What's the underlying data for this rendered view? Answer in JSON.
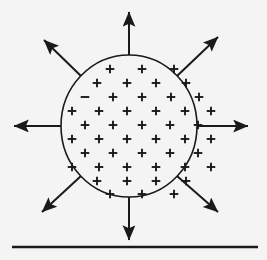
{
  "figure": {
    "background_color": "#f4f4f4",
    "ink_color": "#1a1a1a",
    "width": 267,
    "height": 260
  },
  "sphere": {
    "label": "charged-sphere",
    "center_x": 129,
    "center_y": 126,
    "radius_x": 68,
    "radius_y": 71,
    "stroke_color": "#1a1a1a",
    "stroke_width": 1.6,
    "fill_color": "#f4f4f4"
  },
  "charges": {
    "plus_symbol": "+",
    "minus_symbol": "–",
    "symbol_color": "#1a1a1a",
    "plus_count": 52,
    "minus_count": 1,
    "rows": [
      {
        "y": 69,
        "xs": [
          110,
          142,
          174
        ],
        "signs": [
          "+",
          "+",
          "+"
        ]
      },
      {
        "y": 83,
        "xs": [
          97,
          127,
          156,
          186
        ],
        "signs": [
          "+",
          "+",
          "+",
          "+"
        ]
      },
      {
        "y": 97,
        "xs": [
          85,
          113,
          142,
          171,
          199
        ],
        "signs": [
          "–",
          "+",
          "+",
          "+",
          "+"
        ]
      },
      {
        "y": 111,
        "xs": [
          72,
          99,
          127,
          156,
          185,
          211
        ],
        "signs": [
          "+",
          "+",
          "+",
          "+",
          "+",
          "+"
        ]
      },
      {
        "y": 125,
        "xs": [
          85,
          113,
          142,
          170,
          198
        ],
        "signs": [
          "+",
          "+",
          "+",
          "+",
          "+"
        ]
      },
      {
        "y": 139,
        "xs": [
          72,
          99,
          127,
          156,
          185,
          211
        ],
        "signs": [
          "+",
          "+",
          "+",
          "+",
          "+",
          "+"
        ]
      },
      {
        "y": 153,
        "xs": [
          85,
          113,
          142,
          170,
          198
        ],
        "signs": [
          "+",
          "+",
          "+",
          "+",
          "+"
        ]
      },
      {
        "y": 167,
        "xs": [
          72,
          99,
          127,
          156,
          185,
          211
        ],
        "signs": [
          "+",
          "+",
          "+",
          "+",
          "+",
          "+"
        ]
      },
      {
        "y": 181,
        "xs": [
          97,
          127,
          156,
          186
        ],
        "signs": [
          "+",
          "+",
          "+",
          "+"
        ]
      },
      {
        "y": 194,
        "xs": [
          110,
          142,
          174
        ],
        "signs": [
          "+",
          "+",
          "+"
        ]
      }
    ]
  },
  "field_lines": {
    "label": "electric-field-lines",
    "direction": "outward",
    "count": 8,
    "stroke_color": "#1a1a1a",
    "stroke_width": 2.0,
    "arrows": [
      {
        "name": "field-arrow-up",
        "angle_deg": 270,
        "x1": 129,
        "y1": 55,
        "x2": 129,
        "y2": 12
      },
      {
        "name": "field-arrow-up-right",
        "angle_deg": 315,
        "x1": 177,
        "y1": 76,
        "x2": 218,
        "y2": 37
      },
      {
        "name": "field-arrow-right",
        "angle_deg": 0,
        "x1": 197,
        "y1": 126,
        "x2": 248,
        "y2": 126
      },
      {
        "name": "field-arrow-down-right",
        "angle_deg": 45,
        "x1": 177,
        "y1": 176,
        "x2": 218,
        "y2": 212
      },
      {
        "name": "field-arrow-down",
        "angle_deg": 90,
        "x1": 129,
        "y1": 197,
        "x2": 129,
        "y2": 240
      },
      {
        "name": "field-arrow-down-left",
        "angle_deg": 135,
        "x1": 81,
        "y1": 176,
        "x2": 42,
        "y2": 212
      },
      {
        "name": "field-arrow-left",
        "angle_deg": 180,
        "x1": 61,
        "y1": 126,
        "x2": 14,
        "y2": 126
      },
      {
        "name": "field-arrow-up-left",
        "angle_deg": 225,
        "x1": 81,
        "y1": 76,
        "x2": 44,
        "y2": 40
      }
    ]
  },
  "baseline": {
    "label": "ground-baseline",
    "x1": 12,
    "x2": 258,
    "y": 247,
    "stroke_color": "#1a1a1a",
    "stroke_width": 2.6
  }
}
